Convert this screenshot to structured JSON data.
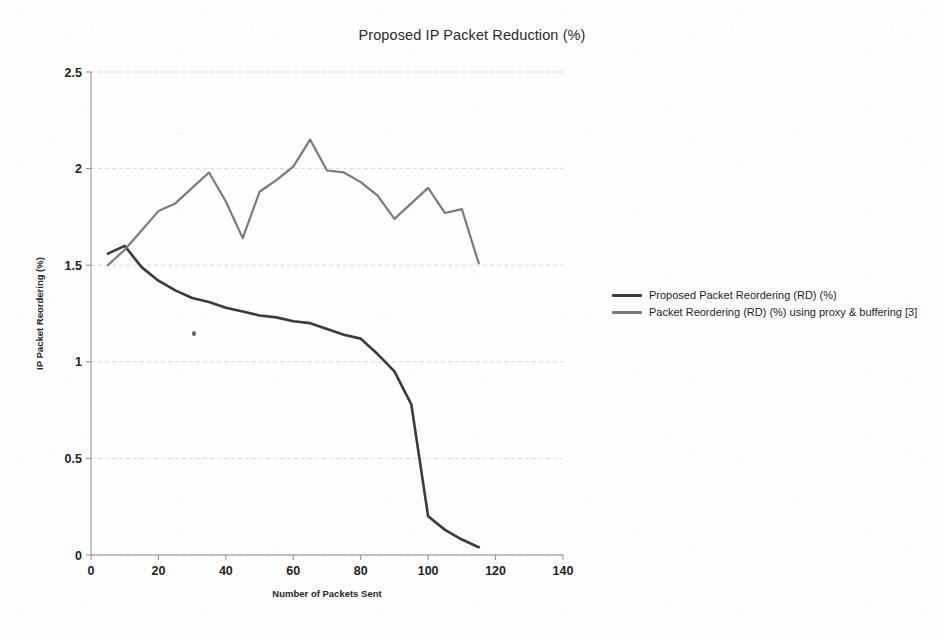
{
  "figure": {
    "title": "Proposed IP Packet Reduction (%)"
  },
  "legend": {
    "position": "right",
    "entries": [
      {
        "label": "Proposed Packet Reordering (RD) (%)",
        "color": "#3b3b3b"
      },
      {
        "label": "Packet Reordering (RD) (%) using proxy & buffering [3]",
        "color": "#7b7b7b"
      }
    ]
  },
  "chart_data": {
    "type": "line",
    "title": "Proposed IP Packet Reduction (%)",
    "xlabel": "Number of Packets Sent",
    "ylabel": "IP Packet Reordering (%)",
    "xlim": [
      0,
      140
    ],
    "ylim": [
      0,
      2.5
    ],
    "xticks": [
      0,
      20,
      40,
      60,
      80,
      100,
      120,
      140
    ],
    "yticks": [
      0,
      0.5,
      1,
      1.5,
      2,
      2.5
    ],
    "xtick_labels": [
      "0",
      "20",
      "40",
      "60",
      "80",
      "100",
      "120",
      "140"
    ],
    "ytick_labels": [
      "0",
      "0.5",
      "1",
      "1.5",
      "2",
      "2.5"
    ],
    "grid": true,
    "series": [
      {
        "name": "Proposed Packet Reordering (RD) (%)",
        "color": "#3b3b3b",
        "width": 2.6,
        "x": [
          5,
          10,
          15,
          20,
          25,
          30,
          35,
          40,
          45,
          50,
          55,
          60,
          65,
          70,
          75,
          80,
          85,
          90,
          95,
          100,
          105,
          110,
          115
        ],
        "y": [
          1.56,
          1.6,
          1.49,
          1.42,
          1.37,
          1.33,
          1.31,
          1.28,
          1.26,
          1.24,
          1.23,
          1.21,
          1.2,
          1.17,
          1.14,
          1.12,
          1.04,
          0.95,
          0.78,
          0.2,
          0.13,
          0.08,
          0.04
        ]
      },
      {
        "name": "Packet Reordering (RD) (%) using proxy & buffering [3]",
        "color": "#7b7b7b",
        "width": 2.2,
        "x": [
          5,
          10,
          15,
          20,
          25,
          30,
          35,
          40,
          45,
          50,
          55,
          60,
          65,
          70,
          75,
          80,
          85,
          90,
          95,
          100,
          105,
          110,
          115
        ],
        "y": [
          1.5,
          1.58,
          1.68,
          1.78,
          1.82,
          1.9,
          1.98,
          1.83,
          1.64,
          1.88,
          1.94,
          2.01,
          2.15,
          1.99,
          1.98,
          1.93,
          1.86,
          1.74,
          1.82,
          1.9,
          1.77,
          1.79,
          1.51
        ]
      }
    ]
  },
  "geometry": {
    "plot_left": 91,
    "plot_right": 563,
    "plot_top": 72,
    "plot_bottom": 555
  }
}
